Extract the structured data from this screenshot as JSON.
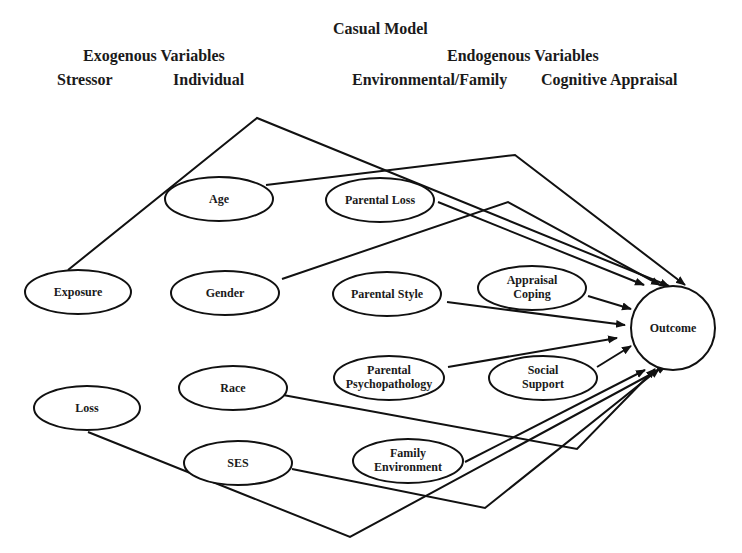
{
  "title": "Casual Model",
  "groups": {
    "exogenous": {
      "label": "Exogenous Variables",
      "columns": [
        "Stressor",
        "Individual"
      ]
    },
    "endogenous": {
      "label": "Endogenous Variables",
      "columns": [
        "Environmental/Family",
        "Cognitive Appraisal"
      ]
    }
  },
  "nodes": {
    "exposure": {
      "lines": [
        "Exposure"
      ],
      "column": "Stressor"
    },
    "loss": {
      "lines": [
        "Loss"
      ],
      "column": "Stressor"
    },
    "age": {
      "lines": [
        "Age"
      ],
      "column": "Individual"
    },
    "gender": {
      "lines": [
        "Gender"
      ],
      "column": "Individual"
    },
    "race": {
      "lines": [
        "Race"
      ],
      "column": "Individual"
    },
    "ses": {
      "lines": [
        "SES"
      ],
      "column": "Individual"
    },
    "parental_loss": {
      "lines": [
        "Parental Loss"
      ],
      "column": "Environmental/Family"
    },
    "parental_style": {
      "lines": [
        "Parental Style"
      ],
      "column": "Environmental/Family"
    },
    "parental_psychopathology": {
      "lines": [
        "Parental",
        "Psychopathology"
      ],
      "column": "Environmental/Family"
    },
    "family_environment": {
      "lines": [
        "Family",
        "Environment"
      ],
      "column": "Environmental/Family"
    },
    "appraisal_coping": {
      "lines": [
        "Appraisal",
        "Coping"
      ],
      "column": "Cognitive Appraisal"
    },
    "social_support": {
      "lines": [
        "Social",
        "Support"
      ],
      "column": "Cognitive Appraisal"
    },
    "outcome": {
      "lines": [
        "Outcome"
      ],
      "column": ""
    }
  },
  "edges": [
    {
      "from": "Exposure",
      "to": "Outcome"
    },
    {
      "from": "Age",
      "to": "Outcome"
    },
    {
      "from": "Parental Loss",
      "to": "Outcome"
    },
    {
      "from": "Gender",
      "to": "Outcome"
    },
    {
      "from": "Appraisal Coping",
      "to": "Outcome"
    },
    {
      "from": "Parental Style",
      "to": "Outcome"
    },
    {
      "from": "Parental Psychopathology",
      "to": "Outcome"
    },
    {
      "from": "Social Support",
      "to": "Outcome"
    },
    {
      "from": "Race",
      "to": "Outcome"
    },
    {
      "from": "Family Environment",
      "to": "Outcome"
    },
    {
      "from": "SES",
      "to": "Outcome"
    },
    {
      "from": "Loss",
      "to": "Outcome"
    }
  ],
  "colors": {
    "ink": "#111111",
    "background": "#ffffff"
  }
}
